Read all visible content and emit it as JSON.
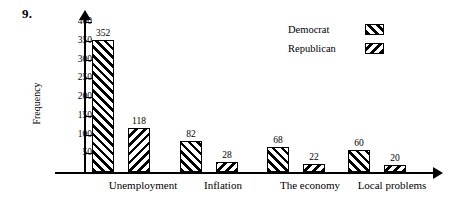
{
  "question_number": "9.",
  "chart_data": {
    "type": "bar",
    "title": "",
    "xlabel": "",
    "ylabel": "Frequency",
    "ylim": [
      0,
      400
    ],
    "ytick_step": 50,
    "yticks": [
      50,
      100,
      150,
      200,
      250,
      300,
      350,
      400
    ],
    "ytick_labels": [
      "50",
      "100",
      "150",
      "200",
      "250",
      "300",
      "350",
      "400"
    ],
    "grid": false,
    "legend_position": "top-right",
    "categories": [
      "Unemployment",
      "Inflation",
      "The economy",
      "Local problems"
    ],
    "series": [
      {
        "name": "Democrat",
        "pattern": "forward-hatch",
        "values": [
          352,
          82,
          68,
          60
        ],
        "value_labels": [
          "352",
          "82",
          "68",
          "60"
        ]
      },
      {
        "name": "Republican",
        "pattern": "backward-hatch",
        "values": [
          118,
          28,
          22,
          20
        ],
        "value_labels": [
          "118",
          "28",
          "22",
          "20"
        ]
      }
    ]
  },
  "legend": {
    "items": [
      {
        "label": "Democrat",
        "pattern": "forward-hatch"
      },
      {
        "label": "Republican",
        "pattern": "backward-hatch"
      }
    ]
  },
  "colors": {
    "axis": "#000000",
    "bar_outline": "#000000",
    "bar_fill": "#ffffff",
    "hatch": "#000000",
    "background": "#ffffff"
  }
}
